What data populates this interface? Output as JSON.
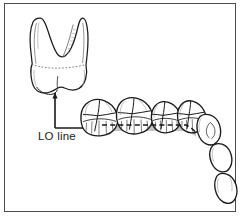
{
  "figure": {
    "name": "lo-line-dental-arch-diagram",
    "domain": "anatomical line drawing",
    "background_color": "#ffffff",
    "ink_color": "#1a1a1a",
    "frame": {
      "border_color": "#4a4a4a",
      "border_width": 1,
      "x": 4,
      "y": 3,
      "width": 232,
      "height": 209
    }
  },
  "labels": {
    "lo_line": "LO line"
  },
  "annotations": {
    "leader": {
      "name": "elbow-arrow",
      "corner_x": 55,
      "corner_y": 128,
      "vertical_tip_x": 55,
      "vertical_tip_y": 90,
      "horizontal_tip_x": 104,
      "horizontal_tip_y": 128,
      "stroke_color": "#1a1a1a",
      "stroke_width": 1.6
    }
  },
  "extracted_tooth": {
    "name": "isolated-maxillary-molar",
    "description": "buccal view of a two-rooted maxillary molar, roots up, crown down",
    "roots": 2,
    "center_x": 60,
    "center_y": 52,
    "cervical_line_style": "dotted"
  },
  "dental_arch": {
    "name": "maxillary-arch-occlusal-oblique-view",
    "lo_band": {
      "label": "LO line",
      "band_color": "#b9b9b9",
      "dash_color": "#1a1a1a",
      "dash_pattern": "5 3",
      "stroke_width": 1.5
    },
    "teeth": [
      {
        "id": "first-molar",
        "type": "molar",
        "cusps": 4,
        "on_lo_line": true
      },
      {
        "id": "second-premolar-adj",
        "type": "molar",
        "cusps": 4,
        "on_lo_line": true
      },
      {
        "id": "second-premolar",
        "type": "premolar",
        "cusps": 2,
        "on_lo_line": true
      },
      {
        "id": "first-premolar",
        "type": "premolar",
        "cusps": 2,
        "on_lo_line": true
      },
      {
        "id": "canine",
        "type": "canine",
        "cusps": 1,
        "on_lo_line": false
      },
      {
        "id": "lateral-incisor",
        "type": "incisor",
        "cusps": 0,
        "on_lo_line": false
      },
      {
        "id": "central-incisor",
        "type": "incisor",
        "cusps": 0,
        "on_lo_line": false
      }
    ]
  }
}
